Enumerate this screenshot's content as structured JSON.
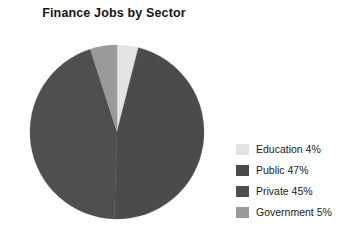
{
  "chart_data": {
    "type": "pie",
    "title": "Finance Jobs by Sector",
    "xlabel": "",
    "ylabel": "",
    "legend_position": "right",
    "grid": false,
    "start_angle_deg": 0,
    "direction": "clockwise",
    "categories": [
      "Education",
      "Public",
      "Private",
      "Government"
    ],
    "values": [
      4,
      47,
      45,
      5
    ],
    "unit": "%",
    "slices": [
      {
        "label": "Education",
        "value": 4,
        "legend_text": "Education 4%",
        "color": "#e3e3e3",
        "start_deg": 0,
        "end_deg": 14.4
      },
      {
        "label": "Public",
        "value": 47,
        "legend_text": "Public 47%",
        "color": "#4b4b4b",
        "start_deg": 14.4,
        "end_deg": 183.6
      },
      {
        "label": "Private",
        "value": 45,
        "legend_text": "Private 45%",
        "color": "#4f4f4f",
        "start_deg": 183.6,
        "end_deg": 345.6
      },
      {
        "label": "Government",
        "value": 5,
        "legend_text": "Government 5%",
        "color": "#9a9a9a",
        "start_deg": 345.6,
        "end_deg": 360
      }
    ]
  },
  "legend": {
    "items": [
      {
        "label": "Education 4%",
        "color": "#e3e3e3"
      },
      {
        "label": "Public 47%",
        "color": "#4b4b4b"
      },
      {
        "label": "Private 45%",
        "color": "#4f4f4f"
      },
      {
        "label": "Government 5%",
        "color": "#9a9a9a"
      }
    ]
  },
  "colors": {
    "background": "#ffffff",
    "text": "#1a1a1a",
    "title": "#141414"
  }
}
